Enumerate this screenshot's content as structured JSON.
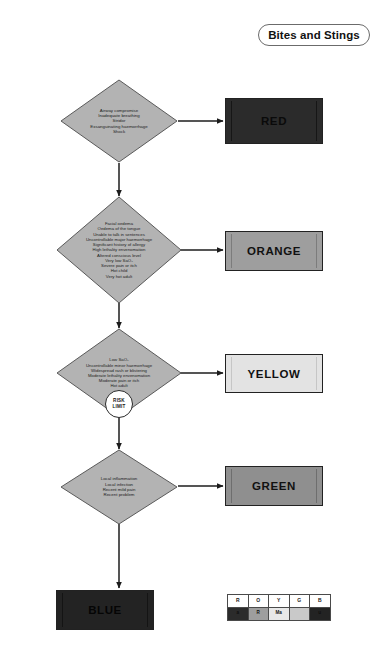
{
  "title": {
    "text": "Bites and Stings"
  },
  "flowchart": {
    "type": "triage-algorithm",
    "nodes": [
      {
        "id": "red-criteria",
        "shape": "diamond",
        "fill": "#b3b3b3",
        "stroke": "#555555",
        "font_size": "4.4px",
        "criteria": [
          "Airway compromise",
          "Inadequate breathing",
          "Stridor",
          "Exsanguinating haemorrhage",
          "Shock"
        ]
      },
      {
        "id": "orange-criteria",
        "shape": "diamond",
        "fill": "#b3b3b3",
        "stroke": "#555555",
        "font_size": "4.3px",
        "criteria": [
          "Facial oedema",
          "Oedema of the tongue",
          "Unable to talk in sentences",
          "Uncontrollable major haemorrhage",
          "Significant history of allergy",
          "High lethality envenomation",
          "Altered conscious level",
          "Very low SaO₂",
          "Severe pain or itch",
          "Hot child",
          "Very hot adult"
        ]
      },
      {
        "id": "yellow-criteria",
        "shape": "diamond",
        "fill": "#b3b3b3",
        "stroke": "#555555",
        "font_size": "4.3px",
        "criteria": [
          "Low SaO₂",
          "Uncontrollable minor haemorrhage",
          "Widespread rash or blistering",
          "Moderate lethality envenomation",
          "Moderate pain or itch",
          "Hot adult"
        ]
      },
      {
        "id": "green-criteria",
        "shape": "diamond",
        "fill": "#b3b3b3",
        "stroke": "#555555",
        "font_size": "4.4px",
        "criteria": [
          "Local inflammation",
          "Local infection",
          "Recent mild pain",
          "Recent problem"
        ]
      }
    ],
    "risk_limit": {
      "line1": "RISK",
      "line2": "LIMIT"
    },
    "categories": [
      {
        "id": "red",
        "label": "RED",
        "fill": "#2b2b2b",
        "text_color": "#0a0a0a",
        "inner_line": "#161616"
      },
      {
        "id": "orange",
        "label": "ORANGE",
        "fill": "#9e9e9e",
        "text_color": "#111111",
        "inner_line": "#7c7c7c"
      },
      {
        "id": "yellow",
        "label": "YELLOW",
        "fill": "#e3e3e3",
        "text_color": "#111111",
        "inner_line": "#c6c6c6"
      },
      {
        "id": "green",
        "label": "GREEN",
        "fill": "#8f8f8f",
        "text_color": "#111111",
        "inner_line": "#6e6e6e"
      },
      {
        "id": "blue",
        "label": "BLUE",
        "fill": "#232323",
        "text_color": "#050505",
        "inner_line": "#141414"
      }
    ]
  },
  "legend": {
    "headers": [
      "R",
      "O",
      "Y",
      "G",
      "B"
    ],
    "swatches": [
      {
        "label": "a",
        "fill": "#2b2b2b",
        "text_color": "#0f0f0f"
      },
      {
        "label": "R",
        "fill": "#9e9e9e",
        "text_color": "#141414"
      },
      {
        "label": "Ma",
        "fill": "#e8e8e8",
        "text_color": "#141414"
      },
      {
        "label": "",
        "fill": "#c9c9c9",
        "text_color": "#141414"
      },
      {
        "label": "u",
        "fill": "#232323",
        "text_color": "#0f0f0f"
      }
    ]
  }
}
